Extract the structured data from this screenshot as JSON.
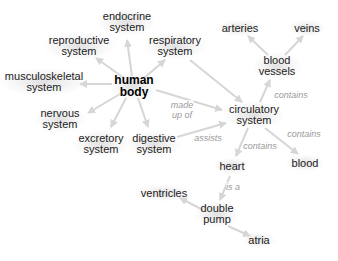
{
  "diagram": {
    "type": "concept-map",
    "colors": {
      "edge": "#d6d6d6",
      "edge_label": "#9a9a9a",
      "node_text": "#222222",
      "central_text": "#000000"
    },
    "nodes": [
      {
        "id": "human_body",
        "line1": "human",
        "line2": "body",
        "x": 134,
        "y": 86,
        "central": true
      },
      {
        "id": "endocrine",
        "line1": "endocrine",
        "line2": "system",
        "x": 127,
        "y": 22
      },
      {
        "id": "reproductive",
        "line1": "reproductive",
        "line2": "system",
        "x": 79,
        "y": 46
      },
      {
        "id": "respiratory",
        "line1": "respiratory",
        "line2": "system",
        "x": 175,
        "y": 46
      },
      {
        "id": "musculoskeletal",
        "line1": "musculoskeletal",
        "line2": "system",
        "x": 44,
        "y": 82
      },
      {
        "id": "nervous",
        "line1": "nervous",
        "line2": "system",
        "x": 60,
        "y": 119
      },
      {
        "id": "excretory",
        "line1": "excretory",
        "line2": "system",
        "x": 101,
        "y": 144
      },
      {
        "id": "digestive",
        "line1": "digestive",
        "line2": "system",
        "x": 154,
        "y": 144
      },
      {
        "id": "circulatory",
        "line1": "circulatory",
        "line2": "system",
        "x": 254,
        "y": 115
      },
      {
        "id": "arteries",
        "line1": "arteries",
        "line2": "",
        "x": 240,
        "y": 28
      },
      {
        "id": "veins",
        "line1": "veins",
        "line2": "",
        "x": 307,
        "y": 28
      },
      {
        "id": "blood_vessels",
        "line1": "blood",
        "line2": "vessels",
        "x": 277,
        "y": 66
      },
      {
        "id": "heart",
        "line1": "heart",
        "line2": "",
        "x": 232,
        "y": 166
      },
      {
        "id": "blood",
        "line1": "blood",
        "line2": "",
        "x": 305,
        "y": 163
      },
      {
        "id": "ventricles",
        "line1": "ventricles",
        "line2": "",
        "x": 164,
        "y": 193
      },
      {
        "id": "double_pump",
        "line1": "double",
        "line2": "pump",
        "x": 217,
        "y": 214
      },
      {
        "id": "atria",
        "line1": "atria",
        "line2": "",
        "x": 259,
        "y": 240
      }
    ],
    "edges": [
      {
        "from": "human_body",
        "to": "endocrine",
        "x1": 132,
        "y1": 76,
        "x2": 127,
        "y2": 40
      },
      {
        "from": "human_body",
        "to": "reproductive",
        "x1": 124,
        "y1": 78,
        "x2": 96,
        "y2": 58
      },
      {
        "from": "human_body",
        "to": "respiratory",
        "x1": 144,
        "y1": 78,
        "x2": 165,
        "y2": 60
      },
      {
        "from": "human_body",
        "to": "musculoskeletal",
        "x1": 112,
        "y1": 84,
        "x2": 80,
        "y2": 84
      },
      {
        "from": "human_body",
        "to": "nervous",
        "x1": 120,
        "y1": 94,
        "x2": 88,
        "y2": 113
      },
      {
        "from": "human_body",
        "to": "excretory",
        "x1": 126,
        "y1": 98,
        "x2": 111,
        "y2": 127
      },
      {
        "from": "human_body",
        "to": "digestive",
        "x1": 138,
        "y1": 98,
        "x2": 148,
        "y2": 127
      },
      {
        "from": "human_body",
        "to": "circulatory",
        "x1": 156,
        "y1": 90,
        "x2": 222,
        "y2": 110
      },
      {
        "from": "respiratory",
        "to": "circulatory",
        "x1": 190,
        "y1": 60,
        "x2": 242,
        "y2": 102
      },
      {
        "from": "digestive",
        "to": "circulatory",
        "x1": 177,
        "y1": 137,
        "x2": 226,
        "y2": 123
      },
      {
        "from": "circulatory",
        "to": "blood_vessels",
        "x1": 260,
        "y1": 102,
        "x2": 270,
        "y2": 80
      },
      {
        "from": "blood_vessels",
        "to": "arteries",
        "x1": 268,
        "y1": 55,
        "x2": 248,
        "y2": 36
      },
      {
        "from": "blood_vessels",
        "to": "veins",
        "x1": 285,
        "y1": 55,
        "x2": 303,
        "y2": 36
      },
      {
        "from": "circulatory",
        "to": "heart",
        "x1": 248,
        "y1": 128,
        "x2": 236,
        "y2": 156
      },
      {
        "from": "circulatory",
        "to": "blood",
        "x1": 265,
        "y1": 128,
        "x2": 298,
        "y2": 154
      },
      {
        "from": "heart",
        "to": "double_pump",
        "x1": 230,
        "y1": 176,
        "x2": 220,
        "y2": 200
      },
      {
        "from": "double_pump",
        "to": "ventricles",
        "x1": 203,
        "y1": 210,
        "x2": 180,
        "y2": 198
      },
      {
        "from": "double_pump",
        "to": "atria",
        "x1": 228,
        "y1": 226,
        "x2": 250,
        "y2": 236
      }
    ],
    "edge_labels": [
      {
        "id": "made_up_of",
        "line1": "made",
        "line2": "up of",
        "x": 182,
        "y": 110
      },
      {
        "id": "assists",
        "line1": "assists",
        "line2": "",
        "x": 208,
        "y": 138
      },
      {
        "id": "contains_vessels",
        "line1": "contains",
        "line2": "",
        "x": 291,
        "y": 95
      },
      {
        "id": "contains_heart",
        "line1": "contains",
        "line2": "",
        "x": 260,
        "y": 146
      },
      {
        "id": "contains_blood",
        "line1": "contains",
        "line2": "",
        "x": 304,
        "y": 134
      },
      {
        "id": "is_a",
        "line1": "is a",
        "line2": "",
        "x": 233,
        "y": 187
      }
    ]
  }
}
